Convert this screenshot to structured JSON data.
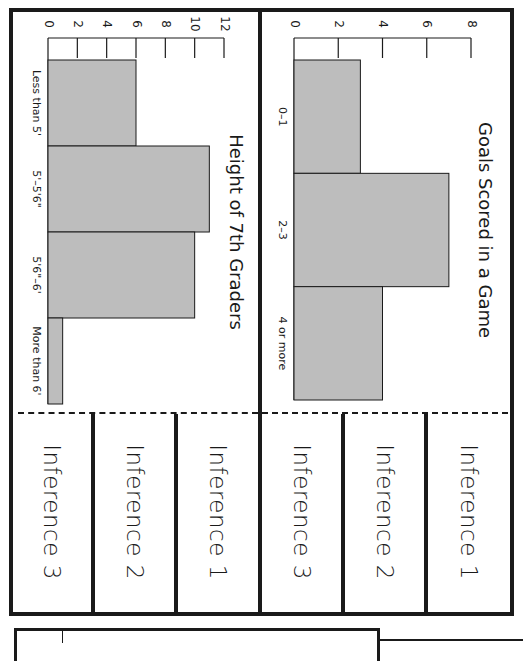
{
  "worksheet": {
    "orientation": "rotated 90 degrees clockwise",
    "inference_labels_left": [
      "Inference 3",
      "Inference 2",
      "Inference 1"
    ],
    "inference_labels_right": [
      "Inference 3",
      "Inference 2",
      "Inference 1"
    ]
  },
  "chart_data": [
    {
      "type": "bar",
      "title": "Goals Scored in a Game",
      "categories": [
        "0–1",
        "2–3",
        "4 or more"
      ],
      "values": [
        3,
        7,
        4
      ],
      "xlabel": "",
      "ylabel": "",
      "yticks": [
        0,
        2,
        4,
        6,
        8
      ],
      "ylim": [
        0,
        8
      ],
      "grid": false,
      "legend": null,
      "style": "histogram (adjacent bars, gray fill)"
    },
    {
      "type": "bar",
      "title": "Height of 7th Graders",
      "categories": [
        "Less than 5'",
        "5'–5'6\"",
        "5'6\"–6'",
        "More than 6'"
      ],
      "values": [
        6,
        11,
        10,
        1
      ],
      "xlabel": "",
      "ylabel": "",
      "yticks": [
        0,
        2,
        4,
        6,
        8,
        10,
        12
      ],
      "ylim": [
        0,
        12
      ],
      "grid": false,
      "legend": null,
      "style": "histogram (adjacent bars, gray fill)"
    }
  ],
  "colors": {
    "bar_fill": "#bdbdbd",
    "ink": "#1a1a1a",
    "paper": "#ffffff"
  }
}
